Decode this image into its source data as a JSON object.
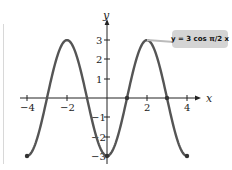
{
  "chart_data": {
    "type": "line",
    "title": "",
    "xlabel": "x",
    "ylabel": "y",
    "xlim": [
      -4,
      4
    ],
    "ylim": [
      -3,
      3
    ],
    "x_ticks": [
      "-4",
      "-2",
      "2",
      "4"
    ],
    "y_ticks": [
      "3",
      "2",
      "1",
      "-1",
      "-2",
      "-3"
    ],
    "grid": false,
    "annotation": "y = 3 cos (π/2) x",
    "series": [
      {
        "name": "y = 3 cos (π/2) x",
        "x": [
          -4,
          -3,
          -2,
          -1,
          0,
          1,
          2,
          3,
          4
        ],
        "values": [
          -3,
          0,
          3,
          0,
          -3,
          0,
          3,
          0,
          -3
        ]
      }
    ],
    "marked_points": [
      [
        -4,
        -3
      ],
      [
        0,
        -3
      ],
      [
        1,
        0
      ],
      [
        3,
        0
      ],
      [
        4,
        -3
      ]
    ],
    "colors": {
      "curve": "#555555",
      "axes": "#222222",
      "label_box": "#d4d4d4"
    }
  },
  "labels": {
    "x_axis": "x",
    "y_axis": "y",
    "equation": "y = 3 cos π/2 x",
    "xt_m4": "−4",
    "xt_m2": "−2",
    "xt_2": "2",
    "xt_4": "4",
    "yt_3": "3",
    "yt_2": "2",
    "yt_1": "1",
    "yt_m1": "−1",
    "yt_m2": "−2",
    "yt_m3": "−3"
  }
}
